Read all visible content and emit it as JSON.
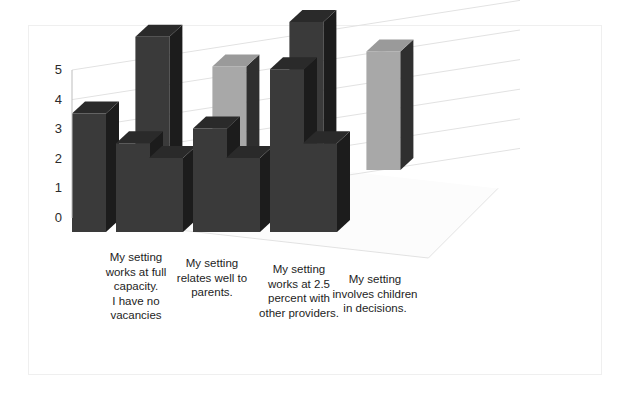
{
  "chart_data": {
    "type": "bar",
    "subtype": "3d-column-two-series",
    "title": "",
    "xlabel": "",
    "ylabel": "",
    "ylim": [
      0,
      5
    ],
    "yticks": [
      "0",
      "1",
      "2",
      "3",
      "4",
      "5"
    ],
    "grid": true,
    "legend": "none",
    "categories": [
      "My setting works at full capacity. I have no vacancies",
      "My setting relates well to parents.",
      "My setting works at 2.5 percent with other providers.",
      "My setting involves children in decisions."
    ],
    "category_lines": [
      [
        "My setting",
        "works at full",
        "capacity.",
        "I have no",
        "vacancies"
      ],
      [
        "My setting",
        "relates well to",
        "parents."
      ],
      [
        "My setting",
        "works at 2.5",
        "percent with",
        "other providers."
      ],
      [
        "My setting",
        "involves children",
        "in decisions."
      ]
    ],
    "series": [
      {
        "name": "Back row",
        "values": [
          4.5,
          3.5,
          5.0,
          4.0
        ]
      },
      {
        "name": "Front row",
        "values": [
          4.0,
          3.0,
          3.5,
          5.5
        ]
      }
    ],
    "bars": [
      {
        "category": 0,
        "row": "back",
        "value": 4.5,
        "color": "#3a3a3a"
      },
      {
        "category": 0,
        "row": "front",
        "value": 4.0,
        "color": "#3a3a3a"
      },
      {
        "category": 1,
        "row": "back",
        "value": 3.5,
        "color": "#a8a8a8"
      },
      {
        "category": 1,
        "row": "front",
        "value": 3.0,
        "color": "#3a3a3a"
      },
      {
        "category": 2,
        "row": "back",
        "value": 5.0,
        "color": "#3a3a3a"
      },
      {
        "category": 2,
        "row": "front",
        "value": 3.5,
        "color": "#3a3a3a"
      },
      {
        "category": 3,
        "row": "back",
        "value": 4.0,
        "color": "#a8a8a8"
      },
      {
        "category": 3,
        "row": "front",
        "value": 5.5,
        "color": "#3a3a3a"
      }
    ],
    "extra_bars": [
      {
        "after_category": 1,
        "row": "front",
        "value": 2.5,
        "color": "#3a3a3a"
      },
      {
        "after_category": 2,
        "row": "front",
        "value": 2.5,
        "color": "#3a3a3a"
      },
      {
        "after_category": 3,
        "row": "front",
        "value": 3.0,
        "color": "#3a3a3a"
      }
    ],
    "colors": {
      "bar_dark_front": "#3a3a3a",
      "bar_dark_side": "#1c1c1c",
      "bar_dark_top": "#2a2a2a",
      "bar_light_front": "#a8a8a8",
      "bar_light_side": "#2f2f2f",
      "bar_light_top": "#9a9a9a",
      "gridline": "#e2e2e2",
      "floor": "#fcfcfc",
      "axis_text": "#2b2b2b",
      "frame": "#efefef"
    }
  },
  "axis": {
    "ticks": [
      "5",
      "4",
      "3",
      "2",
      "1",
      "0"
    ]
  }
}
